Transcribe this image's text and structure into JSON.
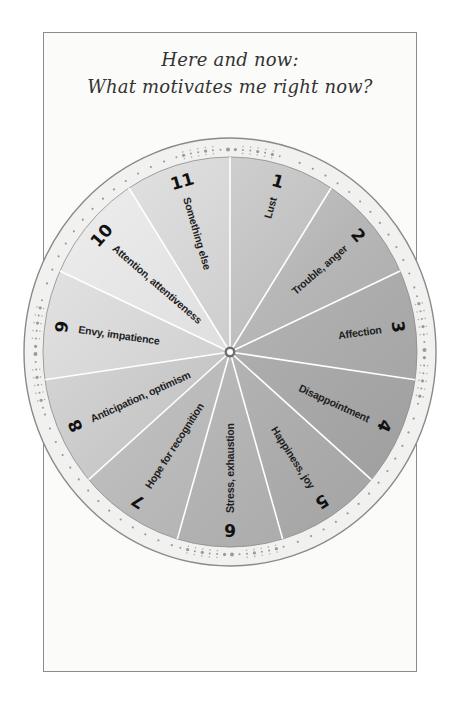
{
  "title": {
    "line1": "Here and now:",
    "line2": "What motivates me right now?"
  },
  "wheel": {
    "center": [
      230,
      352
    ],
    "inner_radius": [
      187,
      195
    ],
    "outer_radius": [
      206,
      214
    ],
    "colors": {
      "ring_fill": "#f1f1ef",
      "ring_border": "#8a8a8a",
      "ring_dots": "#9a9a9a",
      "divider": "#ffffff",
      "gradient_light": "#e6e6e6",
      "gradient_dark": "#a6a6a6",
      "text": "#1e1e1e"
    },
    "segments": [
      {
        "number": "1",
        "label": "Lust",
        "shade": "#b9b9b9"
      },
      {
        "number": "2",
        "label": "Trouble, anger",
        "shade": "#b0b0b0"
      },
      {
        "number": "3",
        "label": "Affection",
        "shade": "#aaaaaa"
      },
      {
        "number": "4",
        "label": "Disappointment",
        "shade": "#a7a7a7"
      },
      {
        "number": "5",
        "label": "Happiness, joy",
        "shade": "#adadad"
      },
      {
        "number": "6",
        "label": "Stress, exhaustion",
        "shade": "#b2b2b2"
      },
      {
        "number": "7",
        "label": "Hope for recognition",
        "shade": "#b6b6b6"
      },
      {
        "number": "8",
        "label": "Anticipation, optimism",
        "shade": "#c2c2c2"
      },
      {
        "number": "9",
        "label": "Envy, impatience",
        "shade": "#cdcdcd"
      },
      {
        "number": "10",
        "label": "Attention, attentiveness",
        "shade": "#dcdcdc"
      },
      {
        "number": "11",
        "label": "Something else",
        "shade": "#c9c9c9"
      }
    ]
  }
}
